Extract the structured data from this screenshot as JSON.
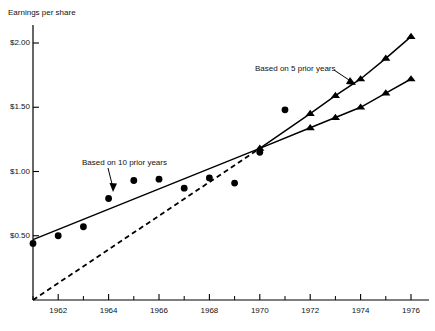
{
  "chart_data": {
    "type": "scatter",
    "title": "",
    "ylabel": "Earnings per share",
    "xlabel": "",
    "xlim": [
      1961,
      1976
    ],
    "ylim": [
      0,
      2.25
    ],
    "grid": false,
    "legend_position": "none",
    "y_ticks": [
      {
        "value": 0.5,
        "label": "$0.50"
      },
      {
        "value": 1.0,
        "label": "$1.00"
      },
      {
        "value": 1.5,
        "label": "$1.50"
      },
      {
        "value": 2.0,
        "label": "$2.00"
      }
    ],
    "x_ticks": [
      {
        "value": 1962,
        "label": "1962"
      },
      {
        "value": 1964,
        "label": "1964"
      },
      {
        "value": 1966,
        "label": "1966"
      },
      {
        "value": 1968,
        "label": "1968"
      },
      {
        "value": 1970,
        "label": "1970"
      },
      {
        "value": 1972,
        "label": "1972"
      },
      {
        "value": 1974,
        "label": "1974"
      },
      {
        "value": 1976,
        "label": "1976"
      }
    ],
    "x_minor_ticks": [
      1961,
      1963,
      1965,
      1967,
      1969,
      1971,
      1973,
      1975
    ],
    "series": [
      {
        "name": "Actual earnings per share",
        "marker": "circle",
        "line": "none",
        "color": "#000000",
        "x": [
          1961,
          1962,
          1963,
          1964,
          1965,
          1966,
          1967,
          1968,
          1969,
          1970,
          1971
        ],
        "values": [
          0.44,
          0.5,
          0.57,
          0.79,
          0.93,
          0.94,
          0.87,
          0.95,
          0.91,
          1.15,
          1.48
        ]
      },
      {
        "name": "Based on 10 prior years",
        "marker": "triangle",
        "line": "solid",
        "color": "#000000",
        "x": [
          1961,
          1970,
          1972,
          1973,
          1974,
          1975,
          1976
        ],
        "values": [
          0.47,
          1.18,
          1.34,
          1.42,
          1.5,
          1.61,
          1.72
        ]
      },
      {
        "name": "Based on 5 prior years",
        "marker": "triangle",
        "line": "solid",
        "color": "#000000",
        "x": [
          1970,
          1972,
          1973,
          1974,
          1975,
          1976
        ],
        "values": [
          1.18,
          1.45,
          1.59,
          1.72,
          1.88,
          2.05
        ]
      },
      {
        "name": "Projection from origin",
        "marker": "none",
        "line": "dashed",
        "color": "#000000",
        "x": [
          1961,
          1970
        ],
        "values": [
          0.0,
          1.18
        ]
      }
    ],
    "annotations": [
      {
        "text": "Based on 10 prior years",
        "x": 1964.0,
        "y": 1.12
      },
      {
        "text": "Based on 5 prior years",
        "x": 1970.6,
        "y": 1.82
      }
    ]
  },
  "axis_title": "Earnings per share",
  "annotation_10yr": "Based on 10 prior years",
  "annotation_5yr": "Based on 5 prior years"
}
